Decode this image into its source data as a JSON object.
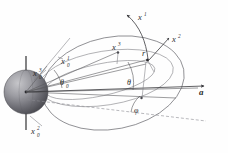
{
  "figure": {
    "kind": "vector-diagram",
    "width": 228,
    "height": 153,
    "background_color": "#fefefe"
  },
  "labels": {
    "x1_orbit_normal": {
      "base": "x",
      "sup": "1",
      "sub": ""
    },
    "x2_orbit": {
      "base": "x",
      "sup": "2",
      "sub": ""
    },
    "x3_orbit": {
      "base": "x",
      "sup": "3",
      "sub": ""
    },
    "x1_body_upper": {
      "base": "x",
      "sup": "1",
      "sub": "0"
    },
    "x3_body_left": {
      "base": "x",
      "sup": "3",
      "sub": "0"
    },
    "x2_body_lower": {
      "base": "x",
      "sup": "2",
      "sub": "0"
    },
    "radius_vector": {
      "base": "r",
      "sup": "",
      "sub": ""
    },
    "acceleration_vector": {
      "base": "a",
      "sup": "",
      "sub": ""
    },
    "theta_zero": {
      "base": "θ",
      "sup": "",
      "sub": "0"
    },
    "theta": {
      "base": "θ",
      "sup": "",
      "sub": ""
    },
    "phi": {
      "base": "φ",
      "sup": "",
      "sub": ""
    }
  },
  "elements": {
    "sphere_name": "central-body-sphere",
    "orbit_name": "orbit-ellipse",
    "equator_name": "equatorial-ellipse",
    "spin_axis_name": "body-spin-axis",
    "satellite_point_name": "satellite-position-marker",
    "center_point_name": "body-center-marker"
  },
  "colors": {
    "stroke_curve": "#6d6d72",
    "stroke_ray": "#5a5a5e",
    "stroke_axis": "#3a3a3e",
    "stroke_dash": "#8a8a90",
    "sphere_light": "#b9b9bd",
    "sphere_dark": "#4e4e54",
    "label_color": "#2b2b2b"
  }
}
